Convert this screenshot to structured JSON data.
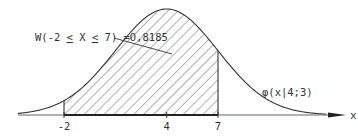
{
  "diagram": {
    "probability_label": "W(-2 ≤ X ≤ 7) = 0,8185",
    "probability_label_parts": {
      "prefix": "W(-2 ",
      "le1": "<",
      "mid": " X ",
      "le2": "<",
      "suffix": " 7) =O,8185"
    },
    "curve_label": "φ(x|4;3)",
    "axis": {
      "label": "x",
      "ticks": [
        {
          "value": -2,
          "label": "-2"
        },
        {
          "value": 4,
          "label": "4"
        },
        {
          "value": 7,
          "label": "7"
        }
      ]
    },
    "distribution": {
      "mean": 4,
      "sd": 3,
      "shaded_from": -2,
      "shaded_to": 7,
      "probability": 0.8185
    },
    "colors": {
      "line": "#333333",
      "hatch": "#555555",
      "background": "#ffffff"
    }
  }
}
